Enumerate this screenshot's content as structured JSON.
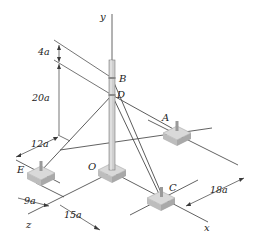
{
  "figure": {
    "type": "3D mechanics diagram: mast with guy cables anchored to ground blocks",
    "axes": {
      "y": "y",
      "x": "x",
      "z": "z"
    },
    "points": {
      "origin": "O",
      "top_attachment": "B",
      "lower_attachment": "D",
      "anchors": [
        "A",
        "C",
        "E"
      ]
    },
    "dimensions": {
      "b_to_d": "4a",
      "d_height": "20a",
      "e_offset": "12a",
      "e_z": "9a",
      "c_z": "15a",
      "c_x": "18a"
    },
    "colors": {
      "line": "#3a3a3a",
      "pole": "#c8c8c8",
      "pole_edge": "#7a7a7a",
      "block_top": "#d9d9d9",
      "block_side": "#b5b5b5",
      "label": "#222222"
    }
  }
}
